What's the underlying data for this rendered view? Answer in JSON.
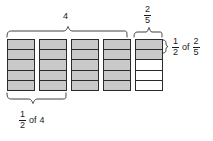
{
  "figure": {
    "title_top_group": "4",
    "top_group_fraction": {
      "numerator": "2",
      "denominator": "5"
    },
    "right_callout": {
      "fraction_a": {
        "numerator": "1",
        "denominator": "2"
      },
      "connector": "of",
      "fraction_b": {
        "numerator": "2",
        "denominator": "5"
      }
    },
    "bottom_callout": {
      "fraction_a": {
        "numerator": "1",
        "denominator": "2"
      },
      "connector": "of",
      "value": "4"
    },
    "colors": {
      "shaded_fill": "#c9c9c9",
      "unshaded_fill": "#ffffff",
      "stroke": "#2b2b2b",
      "text": "#1a1a1a",
      "background": "#ffffff"
    },
    "bars": [
      {
        "name": "bar-1",
        "segments": 5,
        "shaded": [
          true,
          true,
          true,
          true,
          true
        ]
      },
      {
        "name": "bar-2",
        "segments": 5,
        "shaded": [
          true,
          true,
          true,
          true,
          true
        ]
      },
      {
        "name": "bar-3",
        "segments": 5,
        "shaded": [
          true,
          true,
          true,
          true,
          true
        ]
      },
      {
        "name": "bar-4",
        "segments": 5,
        "shaded": [
          true,
          true,
          true,
          true,
          true
        ]
      },
      {
        "name": "bar-5",
        "segments": 5,
        "shaded": [
          true,
          true,
          false,
          false,
          false
        ]
      }
    ]
  }
}
